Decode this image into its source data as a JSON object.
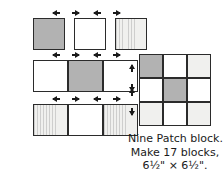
{
  "diagram": {
    "fabrics": {
      "medium_label": "medium gray fabric",
      "white_label": "white fabric",
      "light_label": "light striped fabric"
    },
    "colors": {
      "medium": "#b2b2b2",
      "white": "#ffffff",
      "light": "#f0f0ee",
      "outline": "#2b2b2b",
      "arrow": "#1a1a1a",
      "text": "#1a1a1a"
    },
    "top_row": {
      "name": "individual cut squares",
      "squares": [
        {
          "fabric": "medium",
          "label": "medium square"
        },
        {
          "fabric": "white",
          "label": "white square"
        },
        {
          "fabric": "light",
          "label": "light striped square"
        }
      ]
    },
    "strip_rows": [
      {
        "name": "strip row 2",
        "cells": [
          {
            "fabric": "white",
            "label": "white patch"
          },
          {
            "fabric": "medium",
            "label": "medium patch"
          },
          {
            "fabric": "white",
            "label": "white patch"
          }
        ]
      },
      {
        "name": "strip row 3",
        "cells": [
          {
            "fabric": "light",
            "label": "light striped patch"
          },
          {
            "fabric": "white",
            "label": "white patch"
          },
          {
            "fabric": "light",
            "label": "light striped patch"
          }
        ]
      }
    ],
    "nine_patch": {
      "name": "Nine Patch block",
      "grid": [
        [
          {
            "fabric": "medium",
            "label": "medium patch"
          },
          {
            "fabric": "white",
            "label": "white patch"
          },
          {
            "fabric": "light",
            "label": "light striped patch"
          }
        ],
        [
          {
            "fabric": "white",
            "label": "white patch"
          },
          {
            "fabric": "medium",
            "label": "medium patch"
          },
          {
            "fabric": "white",
            "label": "white patch"
          }
        ],
        [
          {
            "fabric": "light",
            "label": "light striped patch"
          },
          {
            "fabric": "white",
            "label": "white patch"
          },
          {
            "fabric": "light",
            "label": "light striped patch"
          }
        ]
      ]
    },
    "seam_arrows": {
      "horizontal_label": "seam pressing direction arrows",
      "vertical_label": "row seam pressing direction arrows",
      "horizontal_pairs": 6,
      "vertical_pairs": 2
    },
    "caption": {
      "line1": "Nine Patch block.",
      "line2": "Make 17 blocks,",
      "line3": "6½\" × 6½\"."
    }
  }
}
